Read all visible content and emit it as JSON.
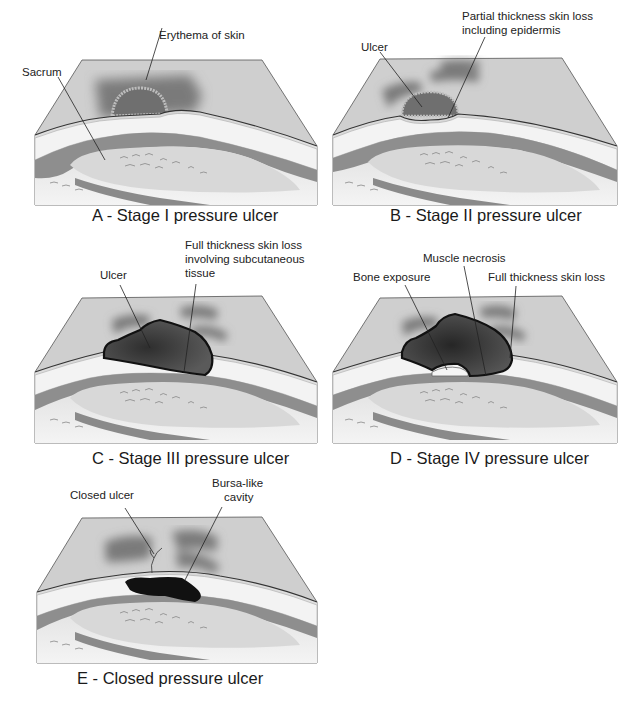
{
  "figure": {
    "panels": [
      {
        "id": "A",
        "caption": "A - Stage I pressure ulcer",
        "labels": [
          "Erythema of skin",
          "Sacrum"
        ]
      },
      {
        "id": "B",
        "caption": "B - Stage II pressure ulcer",
        "labels": [
          "Ulcer",
          "Partial thickness skin loss",
          "including epidermis"
        ]
      },
      {
        "id": "C",
        "caption": "C - Stage III pressure ulcer",
        "labels": [
          "Ulcer",
          "Full thickness skin loss",
          "involving subcutaneous",
          "tissue"
        ]
      },
      {
        "id": "D",
        "caption": "D - Stage IV pressure ulcer",
        "labels": [
          "Bone exposure",
          "Muscle necrosis",
          "Full thickness skin loss"
        ]
      },
      {
        "id": "E",
        "caption": "E - Closed pressure ulcer",
        "labels": [
          "Closed ulcer",
          "Bursa-like",
          "cavity"
        ]
      }
    ]
  },
  "colors": {
    "background": "#ffffff",
    "skin_surface": "#c9c9c9",
    "erythema": "#7d7d7d",
    "fat_layer": "#f2f2f2",
    "muscle": "#8e8e8e",
    "bone": "#d9d9d9",
    "ulcer_dark": "#3a3a3a",
    "cavity": "#111111",
    "outline": "#333333"
  }
}
